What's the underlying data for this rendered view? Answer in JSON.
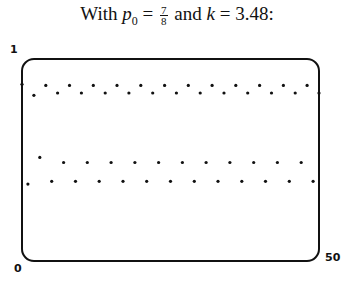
{
  "title": {
    "prefix": "With ",
    "p_symbol": "p",
    "p_subscript": "0",
    "equals1": " = ",
    "frac_num": "7",
    "frac_den": "8",
    "middle": " and ",
    "k_symbol": "k",
    "equals2": " = ",
    "k_value": "3.48:"
  },
  "axis_labels": {
    "y_top": "1",
    "x_left": "0",
    "x_right": "50"
  },
  "chart_data": {
    "type": "scatter",
    "xlabel": "",
    "ylabel": "",
    "xlim": [
      0,
      50
    ],
    "ylim": [
      0,
      1
    ],
    "grid": false,
    "legend": null,
    "x_tick_labels": [
      "0",
      "50"
    ],
    "y_tick_labels": [
      "1"
    ],
    "k": 3.48,
    "p0": 0.875,
    "x": [
      0,
      1,
      2,
      3,
      4,
      5,
      6,
      7,
      8,
      9,
      10,
      11,
      12,
      13,
      14,
      15,
      16,
      17,
      18,
      19,
      20,
      21,
      22,
      23,
      24,
      25,
      26,
      27,
      28,
      29,
      30,
      31,
      32,
      33,
      34,
      35,
      36,
      37,
      38,
      39,
      40,
      41,
      42,
      43,
      44,
      45,
      46,
      47,
      48,
      49,
      50
    ],
    "y": [
      0.875,
      0.3806,
      0.8204,
      0.5128,
      0.8695,
      0.3948,
      0.8315,
      0.4876,
      0.8695,
      0.3948,
      0.8315,
      0.4876,
      0.8695,
      0.3948,
      0.8315,
      0.4876,
      0.8695,
      0.3948,
      0.8315,
      0.4876,
      0.8695,
      0.3948,
      0.8315,
      0.4876,
      0.8695,
      0.3948,
      0.8315,
      0.4876,
      0.8695,
      0.3948,
      0.8315,
      0.4876,
      0.8695,
      0.3948,
      0.8315,
      0.4876,
      0.8695,
      0.3948,
      0.8315,
      0.4876,
      0.8695,
      0.3948,
      0.8315,
      0.4876,
      0.8695,
      0.3948,
      0.8315,
      0.4876,
      0.8695,
      0.3948,
      0.8315
    ]
  },
  "colors": {
    "ink": "#111111",
    "background": "#ffffff"
  }
}
